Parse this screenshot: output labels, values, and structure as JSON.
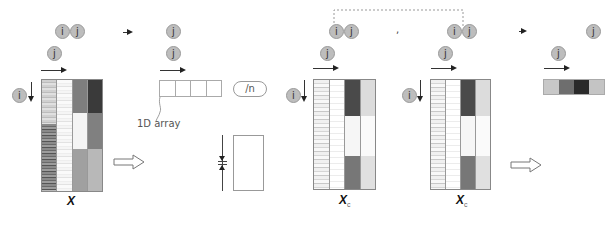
{
  "labels": {
    "i": "i",
    "j": "j",
    "one_d_array": "1D array",
    "divide_n": "/n",
    "matrix_x": "X",
    "matrix_xc": "X",
    "xc_subscript": "c",
    "dot": ","
  },
  "colors": {
    "circle_fill": "#bdbdbd",
    "circle_border": "#9a9a9a",
    "arrow": "#222222",
    "bar_colors": [
      "#c8c8c8",
      "#6e6e6e",
      "#2a2a2a",
      "#c4c4c4"
    ]
  },
  "heatmaps": {
    "x": {
      "columns": [
        "repeating-linear-gradient(180deg,#d0d0d0 0 2px,#bcbcbc 2px 3px,#e0e0e0 3px 5px) 0 0/100% 40% no-repeat, repeating-linear-gradient(180deg,#8a8a8a 0 2px,#6a6a6a 2px 3px,#9c9c9c 3px 5px,#555 5px 6px) 0 100%/100% 60% no-repeat",
        "repeating-linear-gradient(180deg,#fafafa 0 3px,#eeeeee 3px 4px,#f5f5f5 4px 6px,#e2e2e2 6px 7px)",
        "linear-gradient(180deg,#7e7e7e 0 30%,#f4f4f4 30% 62%,#a0a0a0 62% 100%)",
        "linear-gradient(180deg,#3a3a3a 0 30%,#808080 30% 62%,#b8b8b8 62% 100%)"
      ]
    },
    "xc1": {
      "columns": [
        "repeating-linear-gradient(180deg,#f0f0f0 0 3px,#d6d6d6 3px 4px,#f8f8f8 4px 7px,#c8c8c8 7px 8px)",
        "repeating-linear-gradient(180deg,#ffffff 0 5px,#ececec 5px 6px)",
        "linear-gradient(180deg,#4a4a4a 0 33%,#f6f6f6 33% 70%,#777 70% 100%)",
        "linear-gradient(180deg,#dcdcdc 0 33%,#fafafa 33% 70%,#e0e0e0 70% 100%)"
      ]
    },
    "xc2": {
      "columns": [
        "repeating-linear-gradient(180deg,#f0f0f0 0 3px,#d6d6d6 3px 4px,#f8f8f8 4px 7px,#c8c8c8 7px 8px)",
        "repeating-linear-gradient(180deg,#ffffff 0 5px,#ececec 5px 6px)",
        "linear-gradient(180deg,#4a4a4a 0 33%,#f6f6f6 33% 70%,#777 70% 100%)",
        "linear-gradient(180deg,#dcdcdc 0 33%,#fafafa 33% 70%,#e0e0e0 70% 100%)"
      ]
    }
  }
}
